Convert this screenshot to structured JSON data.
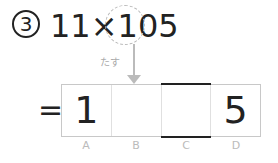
{
  "problem": {
    "number": "3",
    "expression": "11×105",
    "hint_label": "たす",
    "equals": "="
  },
  "answer_boxes": [
    {
      "label": "A",
      "value": "1"
    },
    {
      "label": "B",
      "value": ""
    },
    {
      "label": "C",
      "value": ""
    },
    {
      "label": "D",
      "value": "5"
    }
  ]
}
